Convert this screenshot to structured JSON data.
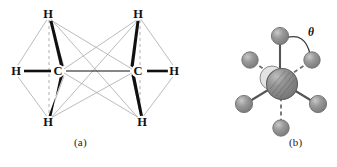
{
  "figure": {
    "panels": [
      {
        "id": "a",
        "caption": "(a)",
        "type": "ball-and-stick-ethane",
        "description": "Ethane molecule showing two tetrahedral carbon centers in eclipsed/staggered representation",
        "atom_labels": {
          "carbon": "C",
          "hydrogen": "H"
        },
        "atoms": [
          {
            "label": "H",
            "x": 48,
            "y": 14,
            "role": "hydrogen-top-left"
          },
          {
            "label": "H",
            "x": 16,
            "y": 71,
            "role": "hydrogen-left-left"
          },
          {
            "label": "H",
            "x": 48,
            "y": 122,
            "role": "hydrogen-bottom-left"
          },
          {
            "label": "C",
            "x": 58,
            "y": 71,
            "role": "carbon-left"
          },
          {
            "label": "C",
            "x": 138,
            "y": 71,
            "role": "carbon-right"
          },
          {
            "label": "H",
            "x": 138,
            "y": 14,
            "role": "hydrogen-top-right"
          },
          {
            "label": "H",
            "x": 174,
            "y": 71,
            "role": "hydrogen-right-right"
          },
          {
            "label": "H",
            "x": 142,
            "y": 122,
            "role": "hydrogen-bottom-right"
          }
        ]
      },
      {
        "id": "b",
        "caption": "(b)",
        "type": "newman-projection",
        "description": "Newman projection down the C-C bond with dihedral angle theta between front and back substituents",
        "angle_symbol": "θ",
        "angle_label_x": 311,
        "angle_label_y": 36
      }
    ],
    "colors": {
      "stroke_dark": "#1a1a1a",
      "stroke_light": "#a9a9a9",
      "sphere_fill": "#8c8c8c",
      "sphere_highlight": "#c8c8c8",
      "sphere_stroke": "#6b6b6b",
      "background": "#ffffff"
    }
  }
}
